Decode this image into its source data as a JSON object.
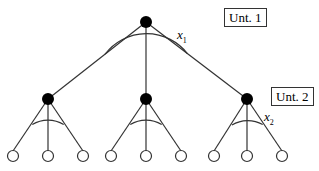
{
  "diagram": {
    "type": "tree",
    "levels": [
      {
        "label": "Unt. 1",
        "angle_label": "x",
        "angle_sub": "1"
      },
      {
        "label": "Unt. 2",
        "angle_label": "x",
        "angle_sub": "2"
      }
    ],
    "root": {
      "x": 146,
      "y": 22
    },
    "children": [
      {
        "x": 48,
        "y": 99,
        "leaves": [
          13,
          48,
          83
        ]
      },
      {
        "x": 146,
        "y": 99,
        "leaves": [
          111,
          146,
          181
        ]
      },
      {
        "x": 247,
        "y": 99,
        "leaves": [
          214,
          247,
          282
        ]
      }
    ],
    "leaf_y": 156,
    "colors": {
      "line": "#333333",
      "node": "#000000",
      "leaf_fill": "#ffffff"
    }
  }
}
